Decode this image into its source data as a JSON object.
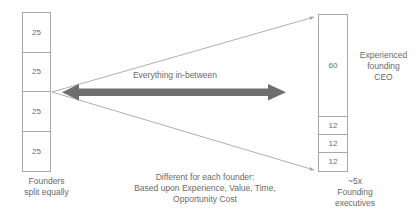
{
  "diagram": {
    "title_text": "Founder equity split spectrum",
    "left_column": {
      "caption": "Founders\nsplit equally",
      "cells": [
        {
          "value": "25"
        },
        {
          "value": "25"
        },
        {
          "value": "25"
        },
        {
          "value": "25"
        }
      ]
    },
    "right_column": {
      "caption": "~5x\nFounding\nexecutives",
      "side_label": "Experienced\nfounding\nCEO",
      "cells": [
        {
          "value": "60",
          "share": 60
        },
        {
          "value": "12",
          "share": 12
        },
        {
          "value": "12",
          "share": 12
        },
        {
          "value": "12",
          "share": 12
        }
      ]
    },
    "center": {
      "arrow_label": "Everything in-between",
      "caption": "Different for each founder:\nBased upon Experience, Value, Time,\nOpportunity Cost"
    },
    "colors": {
      "arrow": "#6e6e6e",
      "box_border": "#a8a8a8",
      "connector": "#9a9a9a",
      "text": "#6a6a6a",
      "background": "#ffffff"
    }
  }
}
